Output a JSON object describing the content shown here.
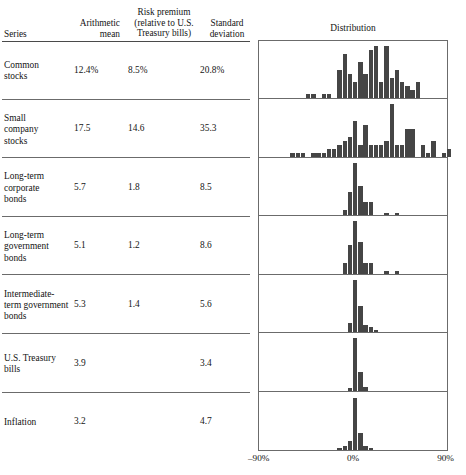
{
  "table": {
    "headers": {
      "series": "Series",
      "arithmetic_mean": "Arithmetic\nmean",
      "arithmetic_mean_line1": "Arithmetic",
      "arithmetic_mean_line2": "mean",
      "risk_premium_line1": "Risk premium",
      "risk_premium_line2": "(relative to U.S.",
      "risk_premium_line3": "Treasury bills)",
      "standard_deviation_line1": "Standard",
      "standard_deviation_line2": "deviation",
      "distribution": "Distribution"
    },
    "rows": [
      {
        "series": "Common stocks",
        "arithmetic_mean": "12.4%",
        "risk_premium": "8.5%",
        "standard_deviation": "20.8%"
      },
      {
        "series": "Small company stocks",
        "arithmetic_mean": "17.5",
        "risk_premium": "14.6",
        "standard_deviation": "35.3"
      },
      {
        "series": "Long-term corporate bonds",
        "arithmetic_mean": "5.7",
        "risk_premium": "1.8",
        "standard_deviation": "8.5"
      },
      {
        "series": "Long-term government bonds",
        "arithmetic_mean": "5.1",
        "risk_premium": "1.2",
        "standard_deviation": "8.6"
      },
      {
        "series": "Intermediate-term government bonds",
        "arithmetic_mean": "5.3",
        "risk_premium": "1.4",
        "standard_deviation": "5.6"
      },
      {
        "series": "U.S. Treasury bills",
        "arithmetic_mean": "3.9",
        "risk_premium": "",
        "standard_deviation": "3.4"
      },
      {
        "series": "Inflation",
        "arithmetic_mean": "3.2",
        "risk_premium": "",
        "standard_deviation": "4.7"
      }
    ]
  },
  "axis": {
    "left_label": "–90%",
    "mid_label": "0%",
    "right_label": "90%",
    "xmin": -90,
    "xmax": 90,
    "zero_label": "0%"
  },
  "chart_data": {
    "type": "bar",
    "title": "Distribution",
    "xlabel": "Annual rate of return (%)",
    "ylabel": "Frequency (number of years)",
    "xlim": [
      -90,
      90
    ],
    "grid": false,
    "legend_position": "none",
    "bin_width": 5,
    "note": "Seven stacked histograms of annual rates of return, one per series. Each histogram shares the same x axis from -90% to +90% with 0% at center. Values are frequency counts per 5% bin.",
    "panels": [
      {
        "name": "Common stocks",
        "max_count": 13,
        "bins": [
          {
            "x": -45,
            "count": 1
          },
          {
            "x": -40,
            "count": 1
          },
          {
            "x": -30,
            "count": 1
          },
          {
            "x": -25,
            "count": 1
          },
          {
            "x": -15,
            "count": 7
          },
          {
            "x": -10,
            "count": 11
          },
          {
            "x": -5,
            "count": 6
          },
          {
            "x": 0,
            "count": 4
          },
          {
            "x": 5,
            "count": 9
          },
          {
            "x": 10,
            "count": 6
          },
          {
            "x": 15,
            "count": 12
          },
          {
            "x": 20,
            "count": 13
          },
          {
            "x": 25,
            "count": 4
          },
          {
            "x": 30,
            "count": 13
          },
          {
            "x": 35,
            "count": 5
          },
          {
            "x": 40,
            "count": 7
          },
          {
            "x": 45,
            "count": 4
          },
          {
            "x": 50,
            "count": 3
          },
          {
            "x": 55,
            "count": 2
          },
          {
            "x": 60,
            "count": 4
          }
        ]
      },
      {
        "name": "Small company stocks",
        "max_count": 13,
        "bins": [
          {
            "x": -60,
            "count": 1
          },
          {
            "x": -55,
            "count": 1
          },
          {
            "x": -50,
            "count": 1
          },
          {
            "x": -40,
            "count": 1
          },
          {
            "x": -35,
            "count": 1
          },
          {
            "x": -30,
            "count": 1
          },
          {
            "x": -25,
            "count": 2
          },
          {
            "x": -20,
            "count": 2
          },
          {
            "x": -15,
            "count": 3
          },
          {
            "x": -10,
            "count": 4
          },
          {
            "x": -5,
            "count": 5
          },
          {
            "x": 0,
            "count": 9
          },
          {
            "x": 5,
            "count": 3
          },
          {
            "x": 10,
            "count": 8
          },
          {
            "x": 15,
            "count": 3
          },
          {
            "x": 20,
            "count": 3
          },
          {
            "x": 25,
            "count": 3
          },
          {
            "x": 30,
            "count": 4
          },
          {
            "x": 35,
            "count": 13
          },
          {
            "x": 40,
            "count": 3
          },
          {
            "x": 45,
            "count": 3
          },
          {
            "x": 50,
            "count": 7
          },
          {
            "x": 55,
            "count": 7
          },
          {
            "x": 65,
            "count": 3
          },
          {
            "x": 70,
            "count": 1
          },
          {
            "x": 75,
            "count": 4
          },
          {
            "x": 85,
            "count": 1
          },
          {
            "x": 90,
            "count": 2
          }
        ]
      },
      {
        "name": "Long-term corporate bonds",
        "max_count": 20,
        "bins": [
          {
            "x": -10,
            "count": 2
          },
          {
            "x": -5,
            "count": 9
          },
          {
            "x": 0,
            "count": 20
          },
          {
            "x": 5,
            "count": 11
          },
          {
            "x": 10,
            "count": 5
          },
          {
            "x": 15,
            "count": 5
          },
          {
            "x": 30,
            "count": 1
          },
          {
            "x": 40,
            "count": 1
          }
        ]
      },
      {
        "name": "Long-term government bonds",
        "max_count": 20,
        "bins": [
          {
            "x": -10,
            "count": 4
          },
          {
            "x": -5,
            "count": 11
          },
          {
            "x": 0,
            "count": 20
          },
          {
            "x": 5,
            "count": 12
          },
          {
            "x": 10,
            "count": 4
          },
          {
            "x": 15,
            "count": 4
          },
          {
            "x": 30,
            "count": 1
          },
          {
            "x": 40,
            "count": 1
          }
        ]
      },
      {
        "name": "Intermediate-term government bonds",
        "max_count": 22,
        "bins": [
          {
            "x": -5,
            "count": 4
          },
          {
            "x": 0,
            "count": 22
          },
          {
            "x": 5,
            "count": 11
          },
          {
            "x": 10,
            "count": 3
          },
          {
            "x": 15,
            "count": 2
          },
          {
            "x": 20,
            "count": 1
          }
        ]
      },
      {
        "name": "U.S. Treasury bills",
        "max_count": 26,
        "bins": [
          {
            "x": -5,
            "count": 1
          },
          {
            "x": 0,
            "count": 26
          },
          {
            "x": 5,
            "count": 9
          },
          {
            "x": 10,
            "count": 2
          }
        ]
      },
      {
        "name": "Inflation",
        "max_count": 24,
        "bins": [
          {
            "x": -15,
            "count": 1
          },
          {
            "x": -10,
            "count": 2
          },
          {
            "x": -5,
            "count": 4
          },
          {
            "x": 0,
            "count": 24
          },
          {
            "x": 5,
            "count": 8
          },
          {
            "x": 10,
            "count": 2
          },
          {
            "x": 15,
            "count": 1
          }
        ]
      }
    ]
  }
}
